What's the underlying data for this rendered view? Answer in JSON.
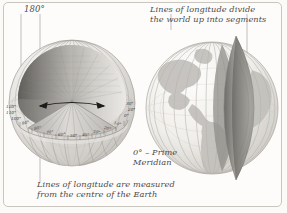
{
  "figure": {
    "background_color": "#fbfaf7",
    "frame_color": "#c9c6bf",
    "text_color": "#4a4a4a"
  },
  "annotations": {
    "top_left_degree": "180°",
    "top_right_caption": "Lines of longitude divide\nthe world up into segments",
    "prime_meridian_caption": "0° – Prime\nMeridian",
    "bottom_caption": "Lines of longitude are measured\nfrom the centre of the Earth"
  },
  "left_globe": {
    "name": "cutaway-globe",
    "description": "Globe with a wedge cut away showing meridians converging at the centre of the Earth",
    "angle_arrow": "double-headed-arrow",
    "sphere_color": "#d8d6d2",
    "meridian_color": "#9a9792",
    "tick_labels_left": [
      "120°",
      "110°",
      "100°"
    ],
    "tick_labels_rim": [
      "90°",
      "80°",
      "70°",
      "60°",
      "50°",
      "40°",
      "30°",
      "20°",
      "10°",
      "0°"
    ],
    "tick_labels_right": [
      "30°",
      "20°"
    ]
  },
  "right_globe": {
    "name": "segment-globe",
    "description": "Globe showing continents with one longitude segment lifted out of the sphere",
    "sphere_color": "#eceae6",
    "land_color": "#c3c1bb",
    "segment_color": "#a8a5a0",
    "meridian_color": "#b5b2ad"
  }
}
